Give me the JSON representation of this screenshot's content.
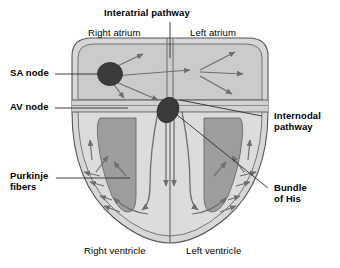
{
  "figure": {
    "type": "anatomical-diagram"
  },
  "labels": {
    "interatrial_pathway": "Interatrial pathway",
    "right_atrium": "Right atrium",
    "left_atrium": "Left atrium",
    "sa_node": "SA node",
    "av_node": "AV node",
    "internodal_pathway_line1": "Internodal",
    "internodal_pathway_line2": "pathway",
    "purkinje_line1": "Purkinje",
    "purkinje_line2": "fibers",
    "bundle_of_his_line1": "Bundle",
    "bundle_of_his_line2": "of His",
    "right_ventricle": "Right ventricle",
    "left_ventricle": "Left ventricle"
  },
  "colors": {
    "background": "#ffffff",
    "heart_wall": "#d4d4d4",
    "atrium_fill": "#cfcfcf",
    "ventricle_wall": "#d9d9d9",
    "chamber_fill": "#9a9a9a",
    "node_fill": "#3a3a3a",
    "outline": "#4a4a4a",
    "arrow": "#6e6e6e",
    "leader_line": "#2b2b2b",
    "text": "#000000"
  },
  "structures": [
    {
      "name": "sinoatrial-node",
      "shape": "circle",
      "label": "SA node"
    },
    {
      "name": "atrioventricular-node",
      "shape": "ellipse",
      "label": "AV node"
    },
    {
      "name": "interatrial-pathway",
      "shape": "septum-line",
      "label": "Interatrial pathway"
    },
    {
      "name": "internodal-pathway",
      "shape": "arrow-path",
      "label": "Internodal pathway"
    },
    {
      "name": "bundle-of-his",
      "shape": "septal-trunk",
      "label": "Bundle of His"
    },
    {
      "name": "purkinje-fibers",
      "shape": "arrow-network",
      "label": "Purkinje fibers"
    },
    {
      "name": "right-atrium",
      "shape": "chamber",
      "label": "Right atrium"
    },
    {
      "name": "left-atrium",
      "shape": "chamber",
      "label": "Left atrium"
    },
    {
      "name": "right-ventricle",
      "shape": "chamber",
      "label": "Right ventricle"
    },
    {
      "name": "left-ventricle",
      "shape": "chamber",
      "label": "Left ventricle"
    }
  ]
}
